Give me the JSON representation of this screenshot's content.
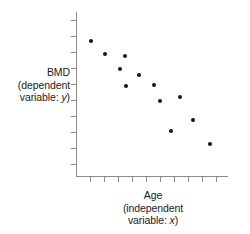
{
  "figure": {
    "background_color": "#ffffff",
    "axis_color": "#8c8c8c",
    "point_color": "#141414",
    "text_color": "#1a1a1a"
  },
  "ylabel": {
    "line1": "BMD",
    "line2": "(dependent",
    "line3_prefix": "variable: ",
    "line3_var": "y",
    "line3_suffix": ")"
  },
  "xlabel": {
    "line1": "Age",
    "line2": "(independent",
    "line3_prefix": "variable: ",
    "line3_var": "x",
    "line3_suffix": ")"
  },
  "chart_data": {
    "type": "scatter",
    "title": "",
    "xlabel": "Age (independent variable: x)",
    "ylabel": "BMD (dependent variable: y)",
    "xlim": [
      0,
      10
    ],
    "ylim": [
      0,
      10
    ],
    "grid": false,
    "legend": "none",
    "x_tick_labels": [],
    "y_tick_labels": [],
    "x_tick_count": 10,
    "y_tick_count": 10,
    "relationship": "negative",
    "series": [
      {
        "name": "BMD vs Age",
        "marker": "filled-circle",
        "color": "#141414",
        "points": [
          {
            "x": 1.0,
            "y": 8.3
          },
          {
            "x": 1.9,
            "y": 7.6
          },
          {
            "x": 2.8,
            "y": 6.8
          },
          {
            "x": 3.2,
            "y": 7.5
          },
          {
            "x": 3.3,
            "y": 5.6
          },
          {
            "x": 4.2,
            "y": 6.3
          },
          {
            "x": 5.2,
            "y": 5.7
          },
          {
            "x": 6.1,
            "y": 4.7
          },
          {
            "x": 7.3,
            "y": 5.1
          },
          {
            "x": 6.9,
            "y": 3.0
          },
          {
            "x": 8.6,
            "y": 3.9
          },
          {
            "x": 9.6,
            "y": 1.9
          }
        ]
      }
    ]
  },
  "plot_geometry": {
    "origin_x_px": 76,
    "origin_y_px": 176,
    "x_axis_length_px": 152,
    "y_axis_length_px": 164,
    "y_axis_top_px": 12,
    "point_positions_px": [
      {
        "x": 91,
        "y": 41
      },
      {
        "x": 105,
        "y": 54
      },
      {
        "x": 120,
        "y": 69
      },
      {
        "x": 125,
        "y": 56
      },
      {
        "x": 126,
        "y": 86
      },
      {
        "x": 139,
        "y": 75
      },
      {
        "x": 154,
        "y": 85
      },
      {
        "x": 160,
        "y": 101
      },
      {
        "x": 180,
        "y": 97
      },
      {
        "x": 171,
        "y": 131
      },
      {
        "x": 193,
        "y": 120
      },
      {
        "x": 210,
        "y": 144
      }
    ],
    "y_tick_positions_px": [
      20,
      36,
      52,
      68,
      84,
      100,
      116,
      132,
      148,
      164
    ],
    "x_tick_positions_px": [
      90,
      104,
      118,
      132,
      146,
      160,
      174,
      188,
      202,
      216
    ]
  }
}
